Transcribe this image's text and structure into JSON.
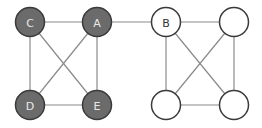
{
  "diagram": {
    "type": "graph",
    "colors": {
      "filled_node": "#6b6b6b",
      "node_stroke": "#3a3a3a",
      "edge": "#8a8a8a",
      "background": "#ffffff"
    },
    "nodes": [
      {
        "id": "C",
        "label": "C",
        "filled": true
      },
      {
        "id": "A",
        "label": "A",
        "filled": true
      },
      {
        "id": "D",
        "label": "D",
        "filled": true
      },
      {
        "id": "E",
        "label": "E",
        "filled": true
      },
      {
        "id": "B",
        "label": "B",
        "filled": false
      },
      {
        "id": "R1",
        "label": "",
        "filled": false
      },
      {
        "id": "R2",
        "label": "",
        "filled": false
      },
      {
        "id": "R3",
        "label": "",
        "filled": false
      }
    ],
    "edges": [
      [
        "C",
        "A"
      ],
      [
        "C",
        "D"
      ],
      [
        "C",
        "E"
      ],
      [
        "A",
        "D"
      ],
      [
        "A",
        "E"
      ],
      [
        "D",
        "E"
      ],
      [
        "A",
        "B"
      ],
      [
        "B",
        "R1"
      ],
      [
        "B",
        "R2"
      ],
      [
        "B",
        "R3"
      ],
      [
        "R1",
        "R2"
      ],
      [
        "R1",
        "R3"
      ],
      [
        "R2",
        "R3"
      ]
    ]
  }
}
